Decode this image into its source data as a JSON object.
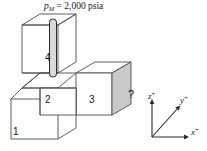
{
  "figure": {
    "pressure_label": {
      "symbol": "p",
      "subscript": "M",
      "equals": "=",
      "value": "2,000",
      "unit": "psia",
      "full_text": "pM = 2,000 psia"
    },
    "blocks": [
      {
        "id": "1",
        "label": "1",
        "name": "block-1"
      },
      {
        "id": "2",
        "label": "2",
        "name": "block-2"
      },
      {
        "id": "3",
        "label": "3",
        "name": "block-3"
      },
      {
        "id": "4",
        "label": "4",
        "name": "block-4"
      }
    ],
    "unknown_marker": "?",
    "tube": {
      "name": "manometer-tube",
      "fill": "#d9d9d9"
    },
    "shaded_face": {
      "name": "block-3-right-face",
      "fill": "#c9c9c9"
    },
    "axes": [
      {
        "id": "z",
        "label": "z",
        "sign": "+",
        "name": "axis-z-positive"
      },
      {
        "id": "y",
        "label": "y",
        "sign": "+",
        "name": "axis-y-positive"
      },
      {
        "id": "x",
        "label": "x",
        "sign": "+",
        "name": "axis-x-positive"
      }
    ],
    "colors": {
      "stroke": "#4d4d4d",
      "stroke_dark": "#2b2b2b",
      "face_light": "#ffffff",
      "face_shaded": "#c9c9c9",
      "tube_fill": "#d9d9d9",
      "text": "#1a1a1a"
    }
  }
}
